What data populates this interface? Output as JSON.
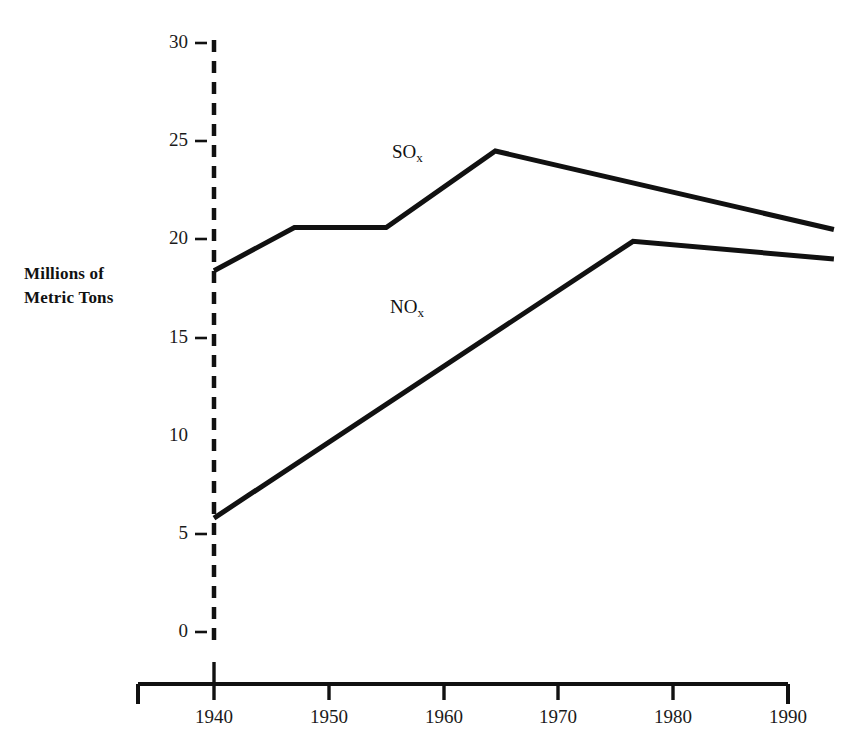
{
  "chart_data": {
    "type": "line",
    "title": "",
    "subtitle": "",
    "xlabel": "",
    "ylabel": "Millions of\nMetric Tons",
    "ylabel_line1": "Millions of",
    "ylabel_line2": "Metric Tons",
    "xlim": [
      1935,
      1994
    ],
    "ylim": [
      0,
      30
    ],
    "grid": false,
    "legend_position": "inline-annotation",
    "x_ticks": [
      1940,
      1950,
      1960,
      1970,
      1980,
      1990
    ],
    "x_tick_labels": [
      "1940",
      "1950",
      "1960",
      "1970",
      "1980",
      "1990"
    ],
    "y_ticks": [
      0,
      5,
      10,
      15,
      20,
      25,
      30
    ],
    "y_tick_labels": [
      "0",
      "5",
      "10",
      "15",
      "20",
      "25",
      "30"
    ],
    "series": [
      {
        "name": "SOx",
        "label_html": "SO<sub>x</sub>",
        "label_main": "SO",
        "label_sub": "x",
        "color": "#111111",
        "x": [
          1940,
          1947,
          1955,
          1964.5,
          1994
        ],
        "values": [
          18.4,
          20.6,
          20.6,
          24.5,
          20.5
        ]
      },
      {
        "name": "NOx",
        "label_html": "NO<sub>x</sub>",
        "label_main": "NO",
        "label_sub": "x",
        "color": "#111111",
        "x": [
          1940,
          1976.5,
          1994
        ],
        "values": [
          5.8,
          19.9,
          19.0
        ]
      }
    ],
    "annotations": [
      {
        "text": "SOx",
        "x": 1964,
        "y": 23.5
      },
      {
        "text": "NOx",
        "x": 1957,
        "y": 16.5
      }
    ],
    "axis_style": {
      "y_axis": "dashed-vertical-at-1940",
      "x_axis": "solid-with-end-caps",
      "line_color": "#111111"
    }
  }
}
